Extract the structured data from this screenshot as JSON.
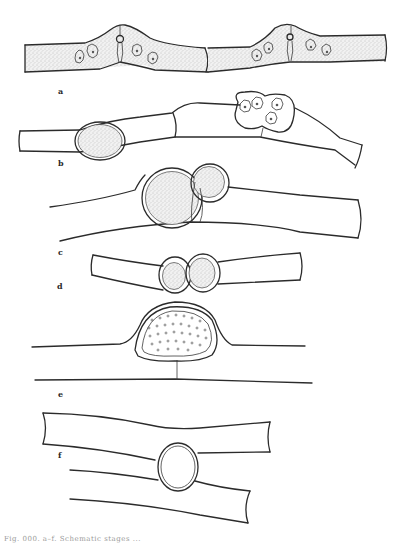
{
  "figure": {
    "panels": [
      {
        "id": "a",
        "label": "a",
        "description": "Two adjacent filaments, each pair of cells with a conjugation bulge and central pore; stippled cytoplasm with star-shaped chloroplasts"
      },
      {
        "id": "b",
        "label": "b",
        "description": "Filament with oval stippled zygospore in left cell and a dumbbell-shaped sac containing four chloroplast bodies in right cell"
      },
      {
        "id": "c",
        "label": "c",
        "description": "Two fused spherical stippled bodies (large and small) within a bulging filament"
      },
      {
        "id": "d",
        "label": "d",
        "description": "Short filament segment with two adjacent rounded stippled spores"
      },
      {
        "id": "e",
        "label": "e",
        "description": "Dome-shaped swelling over a lower filament containing a large oval spore dotted with small circles"
      },
      {
        "id": "f",
        "label": "f",
        "description": "Two crossing filaments joined by a round empty double-walled vesicle"
      }
    ],
    "caption": "Fig. 000. a–f. Schematic stages ...",
    "colors": {
      "background": "#ffffff",
      "ink": "#2b2b2b",
      "stipple": "#9a9a9a"
    }
  }
}
